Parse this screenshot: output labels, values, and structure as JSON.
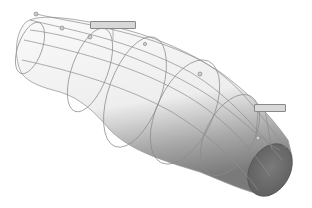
{
  "figure": {
    "colors": {
      "background": "#ffffff",
      "surface_light": "#f4f4f4",
      "surface_shadow": "#8a8a8a",
      "end_cap": "#707070",
      "curve": "#8c8c8c",
      "callout_fill": "#d8d8d8",
      "callout_border": "#888888"
    },
    "callouts": [
      {
        "id": "callout-top",
        "text": "",
        "x": 90,
        "y": 21,
        "w": 44
      },
      {
        "id": "callout-right",
        "text": "",
        "x": 254,
        "y": 104,
        "w": 30
      }
    ]
  }
}
